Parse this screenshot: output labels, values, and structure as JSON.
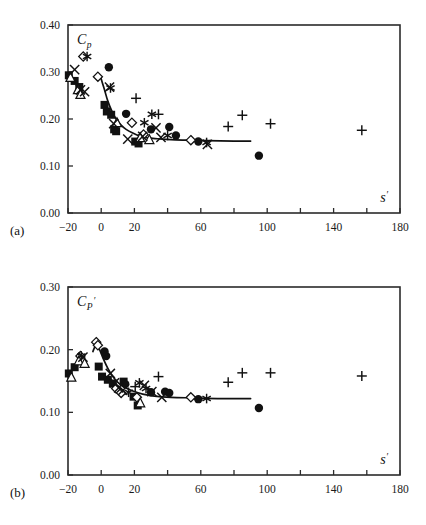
{
  "figure": {
    "background": "#ffffff",
    "ink": "#111111",
    "panels": [
      {
        "id": "a",
        "label": "(a)",
        "ylabel": "C",
        "ylabel_sub": "p",
        "ylabel_prime": "",
        "xlabel": "s",
        "xlabel_prime": "′"
      },
      {
        "id": "b",
        "label": "(b)",
        "ylabel": "C",
        "ylabel_sub": "P",
        "ylabel_prime": "′",
        "xlabel": "s",
        "xlabel_prime": "′"
      }
    ]
  },
  "chart_data": [
    {
      "type": "scatter",
      "panel": "a",
      "title": "",
      "xlabel": "s'",
      "ylabel": "Cp",
      "xlim": [
        -20,
        180
      ],
      "ylim": [
        0.0,
        0.4
      ],
      "xticks": [
        -20,
        0,
        20,
        40,
        60,
        80,
        100,
        120,
        140,
        160,
        180
      ],
      "xticklabels": [
        "−20",
        "0",
        "20",
        "",
        "60",
        "",
        "100",
        "",
        "140",
        "",
        "180"
      ],
      "yticks": [
        0.0,
        0.1,
        0.2,
        0.3,
        0.4
      ],
      "yticklabels": [
        "0.00",
        "0.10",
        "0.20",
        "0.30",
        "0.40"
      ],
      "grid": false,
      "legend": "none",
      "series": [
        {
          "name": "filled-square",
          "marker": "square-filled",
          "points": [
            [
              -19.5,
              0.293
            ],
            [
              -16.0,
              0.281
            ],
            [
              -13.2,
              0.268
            ],
            [
              2.0,
              0.23
            ],
            [
              3.4,
              0.216
            ],
            [
              6.0,
              0.209
            ],
            [
              7.8,
              0.178
            ],
            [
              9.0,
              0.174
            ],
            [
              20.5,
              0.152
            ],
            [
              22.5,
              0.148
            ]
          ]
        },
        {
          "name": "filled-circle",
          "marker": "circle-filled",
          "points": [
            [
              4.6,
              0.31
            ],
            [
              15.0,
              0.211
            ],
            [
              30.0,
              0.178
            ],
            [
              41.0,
              0.183
            ],
            [
              45.0,
              0.165
            ],
            [
              58.5,
              0.152
            ],
            [
              95.0,
              0.122
            ]
          ]
        },
        {
          "name": "open-diamond",
          "marker": "diamond-open",
          "points": [
            [
              -10.8,
              0.333
            ],
            [
              -2.0,
              0.29
            ],
            [
              18.5,
              0.192
            ],
            [
              25.5,
              0.167
            ],
            [
              54.0,
              0.155
            ]
          ]
        },
        {
          "name": "open-triangle",
          "marker": "triangle-open",
          "points": [
            [
              -18.5,
              0.288
            ],
            [
              -14.0,
              0.262
            ],
            [
              -12.5,
              0.252
            ],
            [
              9.5,
              0.192
            ],
            [
              23.5,
              0.16
            ],
            [
              29.0,
              0.156
            ]
          ]
        },
        {
          "name": "cross-x",
          "marker": "x",
          "points": [
            [
              -16.0,
              0.305
            ],
            [
              -12.5,
              0.262
            ],
            [
              -10.0,
              0.258
            ],
            [
              5.0,
              0.268
            ],
            [
              7.5,
              0.19
            ],
            [
              16.0,
              0.157
            ],
            [
              25.0,
              0.163
            ],
            [
              33.0,
              0.181
            ],
            [
              36.0,
              0.161
            ],
            [
              64.0,
              0.146
            ]
          ]
        },
        {
          "name": "asterisk",
          "marker": "asterisk",
          "points": [
            [
              -8.5,
              0.333
            ],
            [
              5.6,
              0.266
            ],
            [
              26.0,
              0.192
            ],
            [
              30.5,
              0.21
            ],
            [
              40.0,
              0.165
            ],
            [
              63.5,
              0.15
            ]
          ]
        },
        {
          "name": "plus",
          "marker": "plus",
          "points": [
            [
              21.0,
              0.244
            ],
            [
              34.5,
              0.21
            ],
            [
              76.5,
              0.184
            ],
            [
              85.0,
              0.208
            ],
            [
              102.0,
              0.19
            ],
            [
              157.0,
              0.176
            ]
          ]
        }
      ],
      "fit_curve": {
        "name": "fitted-curve",
        "points": [
          [
            -0.5,
            0.291
          ],
          [
            2.0,
            0.262
          ],
          [
            4.0,
            0.238
          ],
          [
            6.5,
            0.216
          ],
          [
            9.0,
            0.2
          ],
          [
            12.0,
            0.187
          ],
          [
            15.0,
            0.178
          ],
          [
            19.0,
            0.17
          ],
          [
            23.0,
            0.164
          ],
          [
            28.0,
            0.16
          ],
          [
            34.0,
            0.158
          ],
          [
            42.0,
            0.156
          ],
          [
            52.0,
            0.155
          ],
          [
            64.0,
            0.154
          ],
          [
            80.0,
            0.153
          ],
          [
            90.0,
            0.153
          ]
        ]
      }
    },
    {
      "type": "scatter",
      "panel": "b",
      "title": "",
      "xlabel": "s'",
      "ylabel": "Cp'",
      "xlim": [
        -20,
        180
      ],
      "ylim": [
        0.0,
        0.3
      ],
      "xticks": [
        -20,
        0,
        20,
        40,
        60,
        80,
        100,
        120,
        140,
        160,
        180
      ],
      "xticklabels": [
        "−20",
        "0",
        "20",
        "",
        "60",
        "",
        "100",
        "",
        "140",
        "",
        "180"
      ],
      "yticks": [
        0.0,
        0.1,
        0.2,
        0.3
      ],
      "yticklabels": [
        "0.00",
        "0.10",
        "0.20",
        "0.30"
      ],
      "grid": false,
      "legend": "none",
      "series": [
        {
          "name": "filled-square",
          "marker": "square-filled",
          "points": [
            [
              -19.5,
              0.162
            ],
            [
              -16.0,
              0.172
            ],
            [
              -1.5,
              0.173
            ],
            [
              0.5,
              0.157
            ],
            [
              4.0,
              0.152
            ],
            [
              7.0,
              0.146
            ],
            [
              13.5,
              0.149
            ],
            [
              19.5,
              0.125
            ],
            [
              22.0,
              0.111
            ]
          ]
        },
        {
          "name": "filled-circle",
          "marker": "circle-filled",
          "points": [
            [
              3.0,
              0.19
            ],
            [
              2.0,
              0.197
            ],
            [
              14.5,
              0.145
            ],
            [
              30.0,
              0.132
            ],
            [
              38.5,
              0.133
            ],
            [
              41.0,
              0.131
            ],
            [
              58.5,
              0.121
            ],
            [
              95.0,
              0.107
            ]
          ]
        },
        {
          "name": "open-diamond",
          "marker": "diamond-open",
          "points": [
            [
              -12.5,
              0.19
            ],
            [
              -3.0,
              0.212
            ],
            [
              -2.0,
              0.207
            ],
            [
              9.0,
              0.138
            ],
            [
              12.0,
              0.131
            ],
            [
              21.5,
              0.124
            ],
            [
              54.0,
              0.124
            ]
          ]
        },
        {
          "name": "open-triangle",
          "marker": "triangle-open",
          "points": [
            [
              -18.0,
              0.156
            ],
            [
              -13.5,
              0.182
            ],
            [
              -10.0,
              0.178
            ],
            [
              23.5,
              0.115
            ]
          ]
        },
        {
          "name": "cross-x",
          "marker": "x",
          "points": [
            [
              -11.0,
              0.188
            ],
            [
              5.5,
              0.162
            ],
            [
              8.0,
              0.147
            ],
            [
              10.5,
              0.139
            ],
            [
              13.0,
              0.135
            ],
            [
              26.0,
              0.143
            ],
            [
              30.5,
              0.133
            ],
            [
              36.5,
              0.124
            ]
          ]
        },
        {
          "name": "asterisk",
          "marker": "asterisk",
          "points": [
            [
              -12.0,
              0.19
            ],
            [
              16.5,
              0.132
            ],
            [
              23.0,
              0.147
            ],
            [
              27.0,
              0.138
            ],
            [
              63.5,
              0.122
            ]
          ]
        },
        {
          "name": "plus",
          "marker": "plus",
          "points": [
            [
              20.5,
              0.141
            ],
            [
              34.5,
              0.157
            ],
            [
              76.5,
              0.148
            ],
            [
              85.0,
              0.163
            ],
            [
              102.0,
              0.163
            ],
            [
              157.0,
              0.158
            ]
          ]
        }
      ],
      "fit_curve": {
        "name": "fitted-curve",
        "points": [
          [
            -5.0,
            0.197
          ],
          [
            -3.0,
            0.208
          ],
          [
            -1.0,
            0.2
          ],
          [
            1.5,
            0.184
          ],
          [
            4.0,
            0.17
          ],
          [
            7.0,
            0.157
          ],
          [
            10.0,
            0.148
          ],
          [
            14.0,
            0.14
          ],
          [
            19.0,
            0.134
          ],
          [
            25.0,
            0.129
          ],
          [
            32.0,
            0.126
          ],
          [
            42.0,
            0.124
          ],
          [
            55.0,
            0.123
          ],
          [
            70.0,
            0.122
          ],
          [
            90.0,
            0.122
          ]
        ]
      }
    }
  ]
}
